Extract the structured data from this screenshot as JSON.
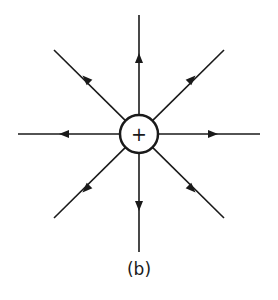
{
  "diagram": {
    "charge": {
      "symbol": "+",
      "center": [
        139,
        134
      ],
      "radius": 19
    },
    "field_lines": [
      {
        "direction": "up",
        "end": [
          139,
          15
        ],
        "arrow": [
          139,
          58
        ]
      },
      {
        "direction": "up-right",
        "end": [
          224,
          50
        ],
        "arrow": [
          192,
          79
        ]
      },
      {
        "direction": "right",
        "end": [
          260,
          134
        ],
        "arrow": [
          213,
          134
        ]
      },
      {
        "direction": "down-right",
        "end": [
          224,
          218
        ],
        "arrow": [
          192,
          189
        ]
      },
      {
        "direction": "down",
        "end": [
          139,
          252
        ],
        "arrow": [
          139,
          206
        ]
      },
      {
        "direction": "down-left",
        "end": [
          54,
          218
        ],
        "arrow": [
          86,
          189
        ]
      },
      {
        "direction": "left",
        "end": [
          18,
          134
        ],
        "arrow": [
          64,
          134
        ]
      },
      {
        "direction": "up-left",
        "end": [
          54,
          50
        ],
        "arrow": [
          86,
          79
        ]
      }
    ],
    "line_color": "#1a1a1a"
  },
  "caption": "(b)",
  "cutoff_text": "lla a la it la a"
}
